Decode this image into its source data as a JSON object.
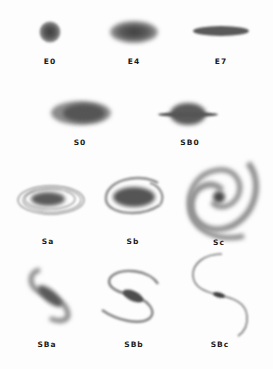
{
  "diagram": {
    "type": "galaxy-morphology-classification",
    "colors": {
      "background": "#fdfdfd",
      "galaxy": "#505050",
      "label": "#1a1a1a"
    },
    "rows": [
      {
        "row": "elliptical",
        "galaxies": [
          {
            "id": "E0",
            "label": "E0",
            "x": 50,
            "label_y": 58
          },
          {
            "id": "E4",
            "label": "E4",
            "x": 134,
            "label_y": 58
          },
          {
            "id": "E7",
            "label": "E7",
            "x": 221,
            "label_y": 58
          }
        ]
      },
      {
        "row": "lenticular",
        "galaxies": [
          {
            "id": "S0",
            "label": "S0",
            "x": 80,
            "label_y": 139
          },
          {
            "id": "SB0",
            "label": "SB0",
            "x": 190,
            "label_y": 139
          }
        ]
      },
      {
        "row": "spiral",
        "galaxies": [
          {
            "id": "Sa",
            "label": "Sa",
            "x": 48,
            "label_y": 238
          },
          {
            "id": "Sb",
            "label": "Sb",
            "x": 133,
            "label_y": 238
          },
          {
            "id": "Sc",
            "label": "Sc",
            "x": 219,
            "label_y": 239
          }
        ]
      },
      {
        "row": "barred-spiral",
        "galaxies": [
          {
            "id": "SBa",
            "label": "SBa",
            "x": 47,
            "label_y": 341
          },
          {
            "id": "SBb",
            "label": "SBb",
            "x": 134,
            "label_y": 341
          },
          {
            "id": "SBc",
            "label": "SBc",
            "x": 220,
            "label_y": 341
          }
        ]
      }
    ]
  }
}
